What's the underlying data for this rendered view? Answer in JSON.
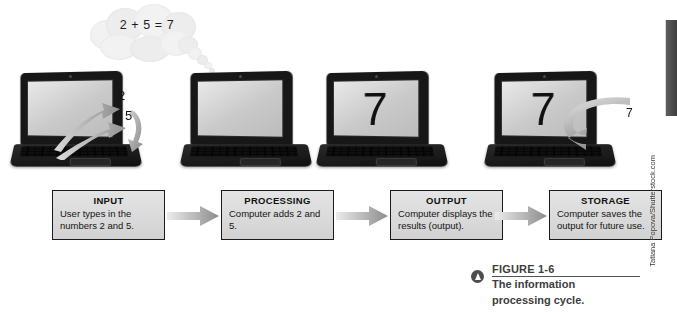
{
  "figure": {
    "label": "FIGURE 1-6",
    "caption_line1": "The information",
    "caption_line2": "processing cycle.",
    "icon": "circle-play-icon"
  },
  "credit": "Tatiana Popova/Shutterstock.com",
  "thought_bubble": {
    "equation": "2 + 5 = 7"
  },
  "laptops": [
    {
      "name": "laptop-input",
      "screen_text": ""
    },
    {
      "name": "laptop-processing",
      "screen_text": ""
    },
    {
      "name": "laptop-output",
      "screen_text": "7"
    },
    {
      "name": "laptop-storage",
      "screen_text": "7"
    }
  ],
  "input_annotations": {
    "number_one": "2",
    "number_two": "5"
  },
  "storage_annotation": {
    "number": "7"
  },
  "flow": {
    "steps": [
      {
        "title": "INPUT",
        "desc": "User types in the numbers 2 and 5."
      },
      {
        "title": "PROCESSING",
        "desc": "Computer adds 2 and 5."
      },
      {
        "title": "OUTPUT",
        "desc": "Computer displays the results (output)."
      },
      {
        "title": "STORAGE",
        "desc": "Computer saves the output for future use."
      }
    ],
    "arrow_icon": "right-arrow-icon"
  },
  "colors": {
    "box_border": "#1b1b1b",
    "box_fill": "#dcdcdc",
    "arrow": "#a9a9a9",
    "caption_text": "#3d3d3d",
    "edge_tab": "#4a4a4a"
  }
}
